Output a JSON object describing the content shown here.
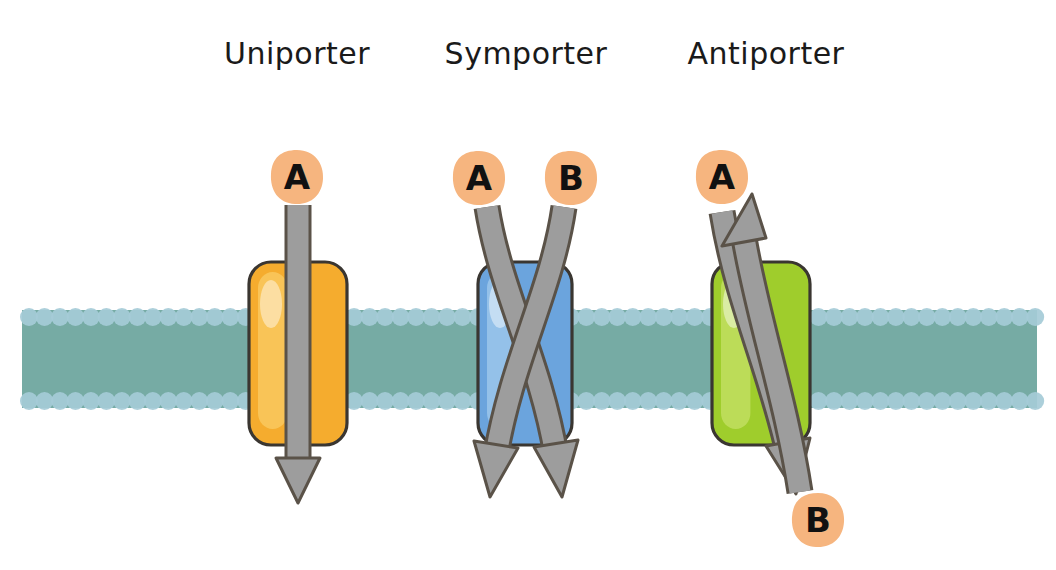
{
  "figure": {
    "kind": "membrane-transport-diagram",
    "background_color": "#ffffff",
    "width": 1056,
    "height": 570
  },
  "membrane": {
    "name": "phospholipid-bilayer",
    "core_color": "#6fa79f",
    "head_color": "#a5cbd7",
    "x_start": 22,
    "x_end": 1037,
    "top_y": 310,
    "bottom_y": 408,
    "head_radius": 9
  },
  "panels": [
    {
      "id": "uniporter",
      "title": "Uniporter",
      "title_x": 297,
      "protein": {
        "name": "uniporter-protein",
        "fill": "#f5ac2e",
        "highlight": "#fcd87a",
        "stroke": "#3a3631",
        "x": 249,
        "y": 262,
        "w": 98,
        "h": 183,
        "r": 22
      },
      "arrows": [
        {
          "label": "A",
          "direction": "down",
          "color": "#9d9d9d",
          "stroke": "#5a5248",
          "path": "M 298 205 L 298 462",
          "head": "M 276 458 L 320 458 L 298 503 Z"
        }
      ],
      "labels": [
        {
          "text": "A",
          "cx": 297,
          "cy": 177,
          "fill": "#f6b57f",
          "text_color": "#111111"
        }
      ]
    },
    {
      "id": "symporter",
      "title": "Symporter",
      "title_x": 526,
      "protein": {
        "name": "symporter-protein",
        "fill": "#6ba4dd",
        "highlight": "#b7d8f3",
        "stroke": "#3a3631",
        "x": 478,
        "y": 262,
        "w": 94,
        "h": 183,
        "r": 22
      },
      "arrows": [
        {
          "label": "A",
          "direction": "down",
          "color": "#9d9d9d",
          "stroke": "#5a5248",
          "path": "M 487 207 C 500 290 540 360 556 455",
          "head": "M 534 447 L 578 440 L 562 497 Z"
        },
        {
          "label": "B",
          "direction": "down",
          "color": "#9d9d9d",
          "stroke": "#5a5248",
          "path": "M 564 207 C 552 290 512 360 496 455",
          "head": "M 474 441 L 518 448 L 490 497 Z"
        }
      ],
      "labels": [
        {
          "text": "A",
          "cx": 479,
          "cy": 178,
          "fill": "#f6b57f",
          "text_color": "#111111"
        },
        {
          "text": "B",
          "cx": 571,
          "cy": 178,
          "fill": "#f6b57f",
          "text_color": "#111111"
        }
      ]
    },
    {
      "id": "antiporter",
      "title": "Antiporter",
      "title_x": 766,
      "protein": {
        "name": "antiporter-protein",
        "fill": "#9fcd2c",
        "highlight": "#d4ea7d",
        "stroke": "#3a3631",
        "x": 712,
        "y": 262,
        "w": 98,
        "h": 183,
        "r": 22
      },
      "arrows": [
        {
          "label": "A",
          "direction": "down",
          "color": "#9d9d9d",
          "stroke": "#5a5248",
          "path": "M 722 212 C 736 300 770 370 788 452",
          "head": "M 766 446 L 810 438 L 796 494 Z"
        },
        {
          "label": "B",
          "direction": "up",
          "color": "#9d9d9d",
          "stroke": "#5a5248",
          "path": "M 800 492 C 786 400 758 320 744 238",
          "head": "M 722 246 L 766 238 L 752 194 Z"
        }
      ],
      "labels": [
        {
          "text": "A",
          "cx": 722,
          "cy": 177,
          "fill": "#f6b57f",
          "text_color": "#111111"
        },
        {
          "text": "B",
          "cx": 818,
          "cy": 520,
          "fill": "#f6b57f",
          "text_color": "#111111"
        }
      ]
    }
  ]
}
